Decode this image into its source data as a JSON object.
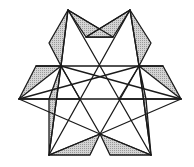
{
  "figure": {
    "title": "",
    "colors": {
      "line": "#1a1a1a",
      "shade": "#c8c8c8",
      "background": "#ffffff"
    },
    "points": {
      "apexL": [
        68,
        10
      ],
      "apexR": [
        130,
        10
      ],
      "flapUL": [
        49,
        43
      ],
      "flapUR": [
        151,
        43
      ],
      "midTopL": [
        86,
        37
      ],
      "midTopR": [
        113,
        37
      ],
      "hexUL": [
        61,
        66
      ],
      "hexTop": [
        100,
        64
      ],
      "hexUR": [
        139,
        66
      ],
      "outUL": [
        36,
        66
      ],
      "outUR": [
        163,
        66
      ],
      "farL": [
        19,
        99
      ],
      "farR": [
        181,
        99
      ],
      "midL": [
        80,
        99
      ],
      "midR": [
        119,
        99
      ],
      "inL": [
        49,
        99
      ],
      "inR": [
        146,
        99
      ],
      "botC": [
        100,
        134
      ],
      "botL": [
        49,
        155
      ],
      "botR": [
        151,
        155
      ],
      "botInL": [
        90,
        155
      ],
      "botInR": [
        110,
        155
      ]
    },
    "lines": [
      [
        "apexL",
        "hexUL"
      ],
      [
        "apexL",
        "botR"
      ],
      [
        "apexL",
        "midTopR"
      ],
      [
        "apexR",
        "hexUR"
      ],
      [
        "apexR",
        "botL"
      ],
      [
        "apexR",
        "midTopL"
      ],
      [
        "outUL",
        "outUR"
      ],
      [
        "farL",
        "farR"
      ],
      [
        "hexUL",
        "botC"
      ],
      [
        "hexUR",
        "botC"
      ],
      [
        "hexUL",
        "midL"
      ],
      [
        "hexUR",
        "midR"
      ],
      [
        "hexUL",
        "farR"
      ],
      [
        "hexUR",
        "farL"
      ],
      [
        "farL",
        "botC"
      ],
      [
        "farR",
        "botC"
      ],
      [
        "hexUL",
        "botL"
      ],
      [
        "hexUR",
        "botR"
      ],
      [
        "botL",
        "botC"
      ],
      [
        "botR",
        "botC"
      ]
    ],
    "shaded": [
      [
        "apexL",
        "flapUL",
        "hexUL"
      ],
      [
        "apexL",
        "midTopL",
        "midTopR"
      ],
      [
        "apexR",
        "flapUR",
        "hexUR"
      ],
      [
        "apexR",
        "midTopR",
        "midTopL"
      ],
      [
        "outUL",
        "hexUL",
        "farL"
      ],
      [
        "outUR",
        "hexUR",
        "farR"
      ],
      [
        "farL",
        "inL",
        "midL"
      ],
      [
        "farR",
        "inR",
        "midR"
      ],
      [
        "botL",
        "hexUL",
        "inL"
      ],
      [
        "botR",
        "hexUR",
        "inR"
      ],
      [
        "botL",
        "botC",
        "botInL"
      ],
      [
        "botR",
        "botC",
        "botInR"
      ]
    ]
  }
}
